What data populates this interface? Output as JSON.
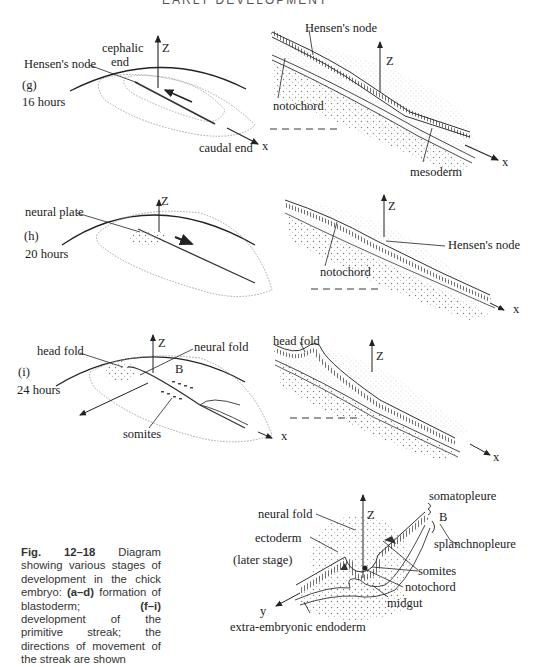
{
  "page_header": "EARLY DEVELOPMENT",
  "panels": {
    "g": {
      "id": "(g)",
      "time": "16 hours",
      "labels": {
        "hensens_node": "Hensen's node",
        "cephalic_end": [
          "cephalic",
          "end"
        ],
        "caudal_end": "caudal end",
        "z": "Z",
        "x": "x"
      },
      "section_labels": {
        "hensens_node": "Hensen's node",
        "notochord": "notochord",
        "mesoderm": "mesoderm",
        "z": "Z",
        "x": "x"
      }
    },
    "h": {
      "id": "(h)",
      "time": "20 hours",
      "labels": {
        "neural_plate": "neural plate",
        "z": "Z"
      },
      "section_labels": {
        "hensens_node": "Hensen's node",
        "notochord": "notochord",
        "z": "Z",
        "x": "x"
      }
    },
    "i": {
      "id": "(i)",
      "time": "24 hours",
      "labels": {
        "head_fold": "head fold",
        "neural_fold": "neural fold",
        "somites": "somites",
        "b": "B",
        "z": "Z",
        "x": "x"
      },
      "section_labels": {
        "head_fold": "head fold",
        "z": "Z",
        "x": "x"
      }
    },
    "later": {
      "stage": "(later stage)",
      "labels": {
        "neural_fold": "neural fold",
        "ectoderm": "ectoderm",
        "somatopleure": "somatopleure",
        "b": "B",
        "splanchnopleure": "splanchnopleure",
        "somites": "somites",
        "notochord": "notochord",
        "midgut": "midgut",
        "extra_embryonic_endoderm": "extra-embryonic endoderm",
        "z": "Z",
        "y": "y"
      }
    }
  },
  "caption": {
    "fig": "Fig. 12–18",
    "text_1": " Diagram showing various stages of development in the chick embryo: ",
    "range_1": "(a–d)",
    "text_2": " formation of blastoderm; ",
    "range_2": "(f–i)",
    "text_3": " development of the primitive streak; the directions of movement of the streak are shown"
  }
}
